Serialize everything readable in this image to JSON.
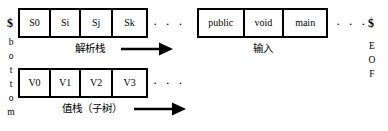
{
  "diagram": {
    "background_color": "#ffffff",
    "line_color": "#000000"
  },
  "left_marker": {
    "dollar": "$",
    "bottom_letters": [
      "b",
      "o",
      "t",
      "t",
      "o",
      "m"
    ],
    "word": "bottom"
  },
  "right_marker": {
    "dollar": "$",
    "eof_letters": [
      "E",
      "O",
      "F"
    ],
    "word": "EOF"
  },
  "parse_stack": {
    "caption": "解析栈",
    "cells": [
      "S0",
      "Si",
      "Sj",
      "Sk"
    ],
    "ellipsis": "· · ·",
    "arrow_direction": "right"
  },
  "value_stack": {
    "caption": "值栈（子树）",
    "cells": [
      "V0",
      "V1",
      "V2",
      "V3"
    ],
    "ellipsis": "· · ·",
    "arrow_direction": "right"
  },
  "input_tape": {
    "caption": "输入",
    "cells": [
      "public",
      "void",
      "main"
    ],
    "ellipsis": "· · ·"
  }
}
